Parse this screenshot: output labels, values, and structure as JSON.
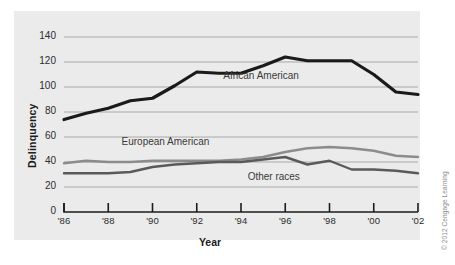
{
  "figure": {
    "background_color": "#ebebeb",
    "page_color": "#ffffff",
    "credit": "© 2012 Cengage Learning"
  },
  "axes": {
    "y_title": "Delinquency",
    "x_title": "Year",
    "y_ticks": [
      "0",
      "20",
      "40",
      "60",
      "80",
      "100",
      "120",
      "140"
    ],
    "x_ticks": [
      "'86",
      "'88",
      "'90",
      "'92",
      "'94",
      "'96",
      "'98",
      "'00",
      "'02"
    ]
  },
  "chart_data": {
    "type": "line",
    "title": "",
    "xlabel": "Year",
    "ylabel": "Delinquency",
    "xlim": [
      1986,
      2002
    ],
    "ylim": [
      0,
      140
    ],
    "grid": true,
    "legend_position": "inline-annotations",
    "x": [
      1986,
      1987,
      1988,
      1989,
      1990,
      1991,
      1992,
      1993,
      1994,
      1995,
      1996,
      1997,
      1998,
      1999,
      2000,
      2001,
      2002
    ],
    "x_tick_labels": [
      "'86",
      "'88",
      "'90",
      "'92",
      "'94",
      "'96",
      "'98",
      "'00",
      "'02"
    ],
    "y_tick_values": [
      0,
      20,
      40,
      60,
      80,
      100,
      120,
      140
    ],
    "series": [
      {
        "name": "African American",
        "color": "#1a1a1a",
        "line_width": 3.2,
        "values": [
          74,
          79,
          83,
          89,
          91,
          101,
          112,
          111,
          111,
          117,
          124,
          121,
          121,
          121,
          110,
          96,
          94
        ],
        "label_x": 1993.2,
        "label_y": 108
      },
      {
        "name": "European American",
        "color": "#8c8c8c",
        "line_width": 2.4,
        "values": [
          39,
          41,
          40,
          40,
          41,
          41,
          41,
          41,
          42,
          44,
          48,
          51,
          52,
          51,
          49,
          45,
          44
        ],
        "label_x": 1988.6,
        "label_y": 55
      },
      {
        "name": "Other races",
        "color": "#5a5a5a",
        "line_width": 2.4,
        "values": [
          31,
          31,
          31,
          32,
          36,
          38,
          39,
          40,
          40,
          42,
          44,
          38,
          41,
          34,
          34,
          33,
          31
        ],
        "label_x": 1994.3,
        "label_y": 27
      }
    ]
  }
}
